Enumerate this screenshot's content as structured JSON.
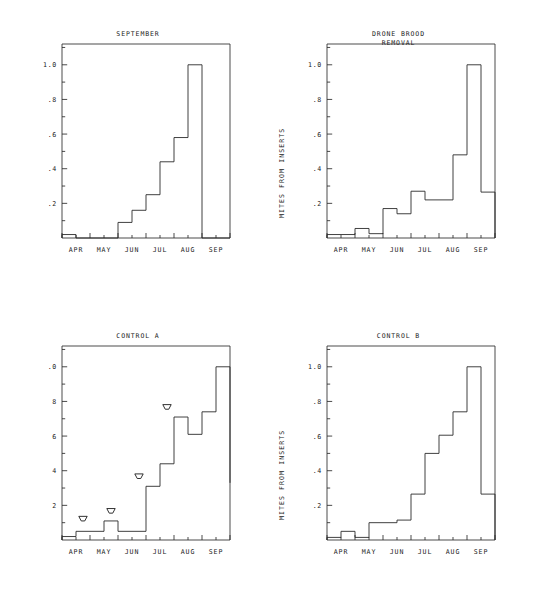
{
  "figure": {
    "background": "#ffffff",
    "ink": "#2b2b2b",
    "month_labels": [
      "APR",
      "MAY",
      "JUN",
      "JUL",
      "AUG",
      "SEP"
    ],
    "y_tick_labels": [
      "1.0",
      ".8",
      ".6",
      ".4",
      ".2"
    ],
    "y_tick_labels_clipped": [
      ".0",
      "8",
      "6",
      "4",
      "2"
    ],
    "y_axis_title": "MITES FROM INSERTS"
  },
  "chart_data": [
    {
      "id": "september",
      "type": "bar",
      "title": "SEPTEMBER",
      "xlabel": "",
      "ylabel": "",
      "ylim": [
        0,
        1.12
      ],
      "grid": false,
      "legend": "none",
      "x_tick_labels": [
        "APR",
        "MAY",
        "JUN",
        "JUL",
        "AUG",
        "SEP"
      ],
      "y_tick_labels": [
        "1.0",
        ".8",
        ".6",
        ".4",
        ".2"
      ],
      "y_major_ticks": [
        0.2,
        0.4,
        0.6,
        0.8,
        1.0
      ],
      "y_minor_ticks": [
        0.1,
        0.3,
        0.5,
        0.7,
        0.9,
        1.1
      ],
      "categories": [
        "APR-1",
        "APR-2",
        "MAY-1",
        "MAY-2",
        "JUN-1",
        "JUN-2",
        "JUL-1",
        "JUL-2",
        "AUG-1",
        "AUG-2",
        "SEP-1",
        "SEP-2"
      ],
      "values": [
        0.02,
        0.0,
        0.0,
        0.0,
        0.09,
        0.16,
        0.25,
        0.44,
        0.58,
        1.0,
        0.0,
        0.0
      ],
      "annotations": []
    },
    {
      "id": "drone-brood-removal",
      "type": "bar",
      "title": "DRONE BROOD\nREMOVAL",
      "title_line1": "DRONE BROOD",
      "title_line2": "REMOVAL",
      "xlabel": "",
      "ylabel": "MITES FROM INSERTS",
      "ylim": [
        0,
        1.12
      ],
      "grid": false,
      "legend": "none",
      "x_tick_labels": [
        "APR",
        "MAY",
        "JUN",
        "JUL",
        "AUG",
        "SEP"
      ],
      "y_tick_labels": [
        "1.0",
        ".8",
        ".6",
        ".4",
        ".2"
      ],
      "y_major_ticks": [
        0.2,
        0.4,
        0.6,
        0.8,
        1.0
      ],
      "y_minor_ticks": [
        0.1,
        0.3,
        0.5,
        0.7,
        0.9,
        1.1
      ],
      "categories": [
        "APR-1",
        "APR-2",
        "MAY-1",
        "MAY-2",
        "JUN-1",
        "JUN-2",
        "JUL-1",
        "JUL-2",
        "AUG-1",
        "AUG-2",
        "SEP-1",
        "SEP-2"
      ],
      "values": [
        0.02,
        0.02,
        0.055,
        0.025,
        0.17,
        0.14,
        0.27,
        0.22,
        0.22,
        0.48,
        1.0,
        0.265
      ],
      "annotations": []
    },
    {
      "id": "control-a",
      "type": "bar",
      "title": "CONTROL A",
      "xlabel": "",
      "ylabel": "",
      "ylim": [
        0,
        1.12
      ],
      "grid": false,
      "legend": "none",
      "x_tick_labels": [
        "APR",
        "MAY",
        "JUN",
        "JUL",
        "AUG",
        "SEP"
      ],
      "y_tick_labels": [
        ".0",
        "8",
        "6",
        "4",
        "2"
      ],
      "y_major_ticks": [
        0.2,
        0.4,
        0.6,
        0.8,
        1.0
      ],
      "y_minor_ticks": [
        0.1,
        0.3,
        0.5,
        0.7,
        0.9,
        1.1
      ],
      "categories": [
        "APR-1",
        "APR-2",
        "MAY-1",
        "MAY-2",
        "JUN-1",
        "JUN-2",
        "JUL-1",
        "JUL-2",
        "AUG-1",
        "AUG-2",
        "SEP-1",
        "SEP-2"
      ],
      "values": [
        0.02,
        0.05,
        0.05,
        0.11,
        0.05,
        0.05,
        0.31,
        0.44,
        0.71,
        0.61,
        0.74,
        1.0
      ],
      "tail_value": 0.33,
      "annotations": [
        {
          "name": "treatment-arrow",
          "x_category": "APR-2",
          "y": 0.11,
          "symbol": "down-arrowhead"
        },
        {
          "name": "treatment-arrow",
          "x_category": "MAY-2",
          "y": 0.155,
          "symbol": "down-arrowhead"
        },
        {
          "name": "treatment-arrow",
          "x_category": "JUN-2",
          "y": 0.355,
          "symbol": "down-arrowhead"
        },
        {
          "name": "treatment-arrow",
          "x_category": "JUL-2",
          "y": 0.755,
          "symbol": "down-arrowhead"
        }
      ]
    },
    {
      "id": "control-b",
      "type": "bar",
      "title": "CONTROL B",
      "xlabel": "",
      "ylabel": "MITES FROM INSERTS",
      "ylim": [
        0,
        1.12
      ],
      "grid": false,
      "legend": "none",
      "x_tick_labels": [
        "APR",
        "MAY",
        "JUN",
        "JUL",
        "AUG",
        "SEP"
      ],
      "y_tick_labels": [
        "1.0",
        ".8",
        ".6",
        ".4",
        ".2"
      ],
      "y_major_ticks": [
        0.2,
        0.4,
        0.6,
        0.8,
        1.0
      ],
      "y_minor_ticks": [
        0.1,
        0.3,
        0.5,
        0.7,
        0.9,
        1.1
      ],
      "categories": [
        "APR-1",
        "APR-2",
        "MAY-1",
        "MAY-2",
        "JUN-1",
        "JUN-2",
        "JUL-1",
        "JUL-2",
        "AUG-1",
        "AUG-2",
        "SEP-1",
        "SEP-2"
      ],
      "values": [
        0.015,
        0.05,
        0.015,
        0.1,
        0.1,
        0.115,
        0.265,
        0.5,
        0.605,
        0.74,
        1.0,
        0.265
      ],
      "annotations": []
    }
  ]
}
